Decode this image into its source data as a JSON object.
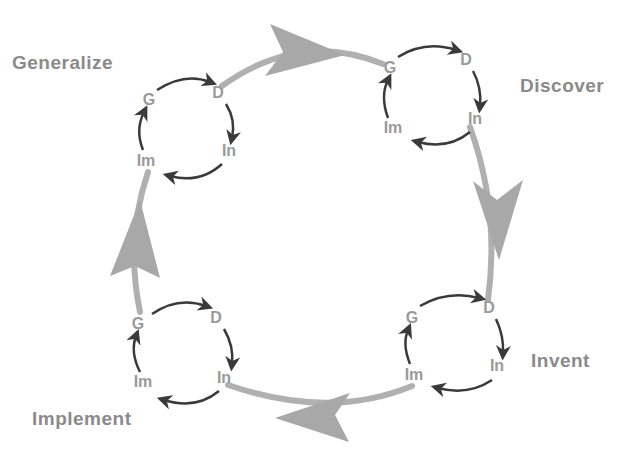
{
  "diagram": {
    "type": "cycle-of-cycles",
    "colors": {
      "big_arrow": "#a8a8a8",
      "small_arrow": "#3a3a3a",
      "phase_text": "#8a8a8a",
      "node_text": "#9a9a9a"
    },
    "phases": [
      {
        "label": "Generalize",
        "x": 12,
        "y": 52
      },
      {
        "label": "Discover",
        "x": 520,
        "y": 75
      },
      {
        "label": "Invent",
        "x": 531,
        "y": 350
      },
      {
        "label": "Implement",
        "x": 32,
        "y": 408
      }
    ],
    "cycles": [
      {
        "name": "generalize-cycle",
        "nodes": [
          {
            "label": "G",
            "x": 149,
            "y": 100
          },
          {
            "label": "D",
            "x": 218,
            "y": 93
          },
          {
            "label": "In",
            "x": 229,
            "y": 151
          },
          {
            "label": "Im",
            "x": 146,
            "y": 161
          }
        ]
      },
      {
        "name": "discover-cycle",
        "nodes": [
          {
            "label": "G",
            "x": 390,
            "y": 68
          },
          {
            "label": "D",
            "x": 466,
            "y": 60
          },
          {
            "label": "In",
            "x": 475,
            "y": 119
          },
          {
            "label": "Im",
            "x": 393,
            "y": 128
          }
        ]
      },
      {
        "name": "invent-cycle",
        "nodes": [
          {
            "label": "G",
            "x": 412,
            "y": 318
          },
          {
            "label": "D",
            "x": 489,
            "y": 308
          },
          {
            "label": "In",
            "x": 497,
            "y": 366
          },
          {
            "label": "Im",
            "x": 414,
            "y": 375
          }
        ]
      },
      {
        "name": "implement-cycle",
        "nodes": [
          {
            "label": "G",
            "x": 138,
            "y": 324
          },
          {
            "label": "D",
            "x": 216,
            "y": 318
          },
          {
            "label": "In",
            "x": 224,
            "y": 378
          },
          {
            "label": "Im",
            "x": 143,
            "y": 382
          }
        ]
      }
    ]
  }
}
